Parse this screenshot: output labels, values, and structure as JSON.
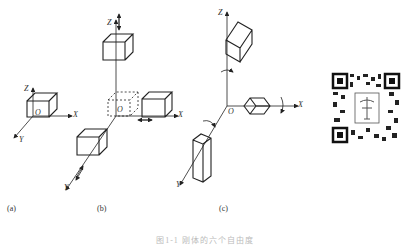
{
  "figure": {
    "panels": [
      {
        "id": "a",
        "label": "(a)",
        "axes": {
          "x": "X",
          "y": "Y",
          "z": "Z",
          "origin": "O"
        }
      },
      {
        "id": "b",
        "label": "(b)",
        "axes": {
          "x": "X",
          "y": "Y",
          "z": "Z",
          "origin": "O"
        }
      },
      {
        "id": "c",
        "label": "(c)",
        "axes": {
          "x": "X",
          "y": "Y",
          "z": "Z",
          "origin": "O"
        }
      }
    ],
    "caption": "图1-1 刚体的六个自由度"
  },
  "qr_code": {
    "present": true
  }
}
